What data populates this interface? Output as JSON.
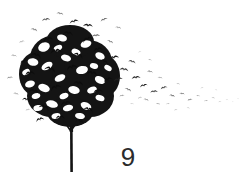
{
  "page": {
    "width": 241,
    "height": 190,
    "background_color": "#ffffff",
    "caption_number": "9"
  },
  "artwork": {
    "title": "Tree dissolving into a flock of birds",
    "description": "A black ink-style tree whose dense canopy is composed of bird silhouettes, with the birds dispersing to the right in a thinning, fading stream.",
    "ink_color": "#111111",
    "mid_color": "#555555",
    "light_color": "#9a9a9a",
    "faint_color": "#c4c4c4",
    "canopy": {
      "center_x": 72,
      "center_y": 74,
      "radius_x": 52,
      "radius_y": 56
    },
    "trunk": {
      "x": 71,
      "top_y": 126,
      "bottom_y": 172,
      "width": 2.6,
      "color": "#141414"
    },
    "flock_trail": {
      "start_x": 112,
      "end_x": 238,
      "start_y": 62,
      "end_y": 103,
      "direction": "rightward"
    }
  }
}
